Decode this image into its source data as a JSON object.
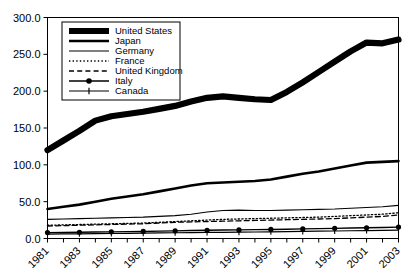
{
  "chart_data": {
    "type": "line",
    "title": "",
    "xlabel": "",
    "ylabel": "",
    "xlim": [
      1981,
      2003
    ],
    "ylim": [
      0.0,
      300.0
    ],
    "grid": false,
    "legend_position": "upper-left",
    "x": [
      1981,
      1982,
      1983,
      1984,
      1985,
      1986,
      1987,
      1988,
      1989,
      1990,
      1991,
      1992,
      1993,
      1994,
      1995,
      1996,
      1997,
      1998,
      1999,
      2000,
      2001,
      2002,
      2003
    ],
    "xtick_labels": [
      "1981",
      "1983",
      "1985",
      "1987",
      "1989",
      "1991",
      "1993",
      "1995",
      "1997",
      "1999",
      "2001",
      "2003"
    ],
    "xtick_values": [
      1981,
      1983,
      1985,
      1987,
      1989,
      1991,
      1993,
      1995,
      1997,
      1999,
      2001,
      2003
    ],
    "ytick_labels": [
      "0.0",
      "50.0",
      "100.0",
      "150.0",
      "200.0",
      "250.0",
      "300.0"
    ],
    "ytick_values": [
      0.0,
      50.0,
      100.0,
      150.0,
      200.0,
      250.0,
      300.0
    ],
    "series": [
      {
        "name": "United States",
        "style": "thick-solid",
        "values": [
          120.0,
          133.0,
          146.0,
          160.0,
          166.0,
          169.0,
          172.0,
          176.0,
          180.0,
          186.0,
          191.0,
          193.0,
          191.0,
          189.0,
          188.0,
          199.0,
          212.0,
          226.0,
          240.0,
          254.0,
          266.0,
          265.0,
          270.0
        ]
      },
      {
        "name": "Japan",
        "style": "medium-solid",
        "values": [
          40.0,
          43.0,
          46.0,
          50.0,
          54.0,
          57.0,
          60.0,
          64.0,
          68.0,
          72.0,
          75.0,
          76.0,
          77.0,
          78.0,
          80.0,
          84.0,
          88.0,
          91.0,
          95.0,
          99.0,
          103.0,
          104.0,
          105.0
        ]
      },
      {
        "name": "Germany",
        "style": "thin-solid",
        "values": [
          26.0,
          26.5,
          27.0,
          27.5,
          28.0,
          28.5,
          29.0,
          30.0,
          31.0,
          33.0,
          36.0,
          38.0,
          38.5,
          38.0,
          38.0,
          38.5,
          39.0,
          39.5,
          40.0,
          41.0,
          42.0,
          43.0,
          45.0
        ]
      },
      {
        "name": "France",
        "style": "dotted",
        "values": [
          18.0,
          18.5,
          19.0,
          19.5,
          20.0,
          20.5,
          21.0,
          22.0,
          23.0,
          24.0,
          25.0,
          26.0,
          26.5,
          27.0,
          27.5,
          28.0,
          28.5,
          29.0,
          30.0,
          31.0,
          32.0,
          33.0,
          35.0
        ]
      },
      {
        "name": "United Kingdom",
        "style": "dashed",
        "values": [
          17.0,
          17.5,
          18.0,
          18.5,
          19.0,
          19.5,
          20.0,
          21.0,
          22.0,
          22.5,
          23.0,
          23.5,
          24.0,
          24.5,
          25.0,
          25.5,
          26.0,
          26.5,
          27.0,
          28.0,
          29.0,
          30.0,
          32.0
        ]
      },
      {
        "name": "Italy",
        "style": "solid-circle-markers",
        "values": [
          8.0,
          8.2,
          8.5,
          8.8,
          9.0,
          9.3,
          9.6,
          10.0,
          10.4,
          10.8,
          11.2,
          11.5,
          11.7,
          12.0,
          12.3,
          12.6,
          13.0,
          13.4,
          13.8,
          14.2,
          14.6,
          15.0,
          15.5
        ]
      },
      {
        "name": "Canada",
        "style": "solid-plus-markers",
        "values": [
          6.0,
          6.2,
          6.4,
          6.6,
          6.8,
          7.0,
          7.2,
          7.5,
          7.8,
          8.0,
          8.2,
          8.4,
          8.6,
          8.8,
          9.0,
          9.3,
          9.6,
          9.9,
          10.2,
          10.5,
          10.8,
          11.1,
          11.5
        ]
      }
    ]
  },
  "legend": {
    "entries": [
      {
        "label": "United States"
      },
      {
        "label": "Japan"
      },
      {
        "label": "Germany"
      },
      {
        "label": "France"
      },
      {
        "label": "United Kingdom"
      },
      {
        "label": "Italy"
      },
      {
        "label": "Canada"
      }
    ]
  },
  "colors": {
    "ink": "#000000",
    "background": "#ffffff"
  }
}
